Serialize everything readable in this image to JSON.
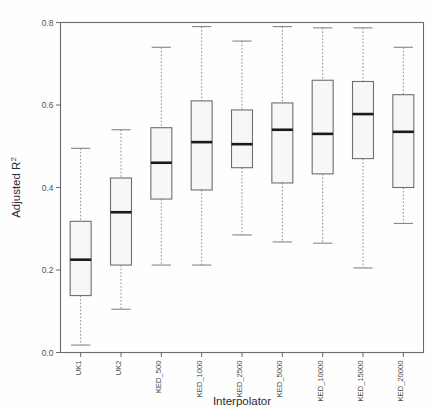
{
  "chart_data": {
    "type": "box",
    "title": "",
    "xlabel": "Interpolator",
    "ylabel": "Adjusted R²",
    "ylim": [
      0.0,
      0.8
    ],
    "yticks": [
      0.0,
      0.2,
      0.4,
      0.6,
      0.8
    ],
    "ytick_labels": [
      "0.0",
      "0.2",
      "0.4",
      "0.6",
      "0.8"
    ],
    "grid": false,
    "legend": "none",
    "categories": [
      "UK1",
      "UK2",
      "KED_500",
      "KED_1000",
      "KED_2500",
      "KED_5000",
      "KED_10000",
      "KED_15000",
      "KED_20000"
    ],
    "boxes": [
      {
        "category": "UK1",
        "min": 0.018,
        "q1": 0.138,
        "median": 0.225,
        "q3": 0.318,
        "max": 0.495
      },
      {
        "category": "UK2",
        "min": 0.105,
        "q1": 0.212,
        "median": 0.34,
        "q3": 0.423,
        "max": 0.54
      },
      {
        "category": "KED_500",
        "min": 0.212,
        "q1": 0.372,
        "median": 0.46,
        "q3": 0.545,
        "max": 0.74
      },
      {
        "category": "KED_1000",
        "min": 0.212,
        "q1": 0.394,
        "median": 0.51,
        "q3": 0.61,
        "max": 0.79
      },
      {
        "category": "KED_2500",
        "min": 0.285,
        "q1": 0.448,
        "median": 0.505,
        "q3": 0.588,
        "max": 0.755
      },
      {
        "category": "KED_5000",
        "min": 0.268,
        "q1": 0.411,
        "median": 0.54,
        "q3": 0.605,
        "max": 0.79
      },
      {
        "category": "KED_10000",
        "min": 0.265,
        "q1": 0.433,
        "median": 0.53,
        "q3": 0.66,
        "max": 0.787
      },
      {
        "category": "KED_15000",
        "min": 0.205,
        "q1": 0.47,
        "median": 0.578,
        "q3": 0.657,
        "max": 0.787
      },
      {
        "category": "KED_20000",
        "min": 0.313,
        "q1": 0.4,
        "median": 0.535,
        "q3": 0.625,
        "max": 0.74
      }
    ],
    "colors": {
      "box_fill": "#f7f7f7",
      "box_stroke": "#6e6e6e",
      "median": "#1a1a1a",
      "whisker": "#8c8c8c",
      "frame": "#6b6b6b",
      "text": "#2b2b2b"
    }
  },
  "axis": {
    "y_title": "Adjusted R",
    "y_title_sup": "2",
    "x_title": "Interpolator"
  }
}
